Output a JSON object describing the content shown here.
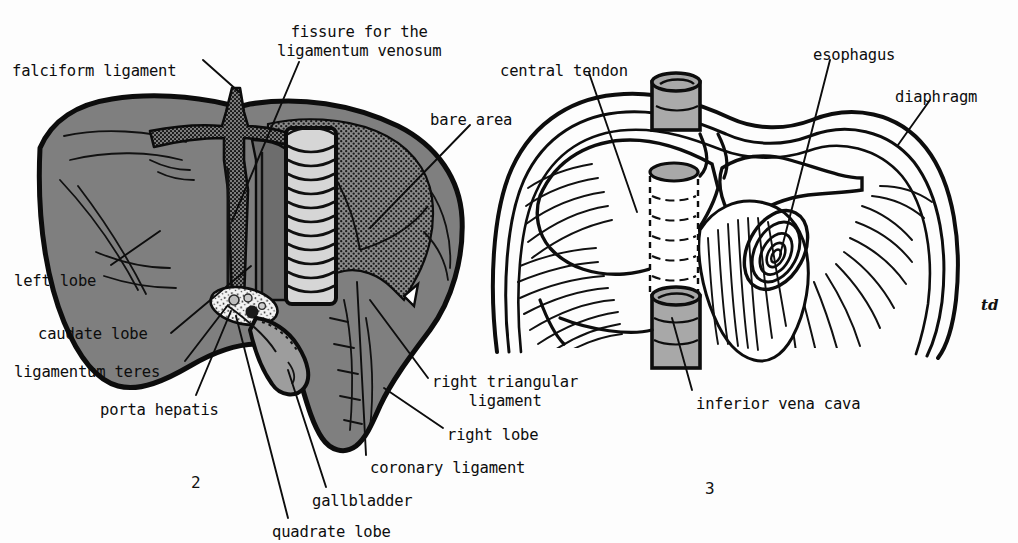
{
  "figure": {
    "type": "anatomical-illustration",
    "signature": "td",
    "background_color": "#ffffff",
    "ink_color": "#111111"
  },
  "palette": {
    "liver_fill": "#7f7f7f",
    "liver_outline": "#101010",
    "bare_area_stipple": "#6e6e6e",
    "ivc_cylinder": "#d2d2d2",
    "gallbladder": "#9a9a9a",
    "porta_hepatis": "#f2f2f2",
    "paper": "#ffffff"
  },
  "figure2": {
    "number": "2",
    "caption": "liver",
    "labels": [
      {
        "id": "falciform-ligament",
        "text": "falciform ligament",
        "x": 12,
        "y": 62,
        "align": "left"
      },
      {
        "id": "fissure-ligamentum-venosum",
        "text": "fissure for the\nligamentum venosum",
        "x": 277,
        "y": 23,
        "align": "left"
      },
      {
        "id": "bare-area",
        "text": "bare area",
        "x": 430,
        "y": 111,
        "align": "left"
      },
      {
        "id": "left-lobe",
        "text": "left lobe",
        "x": 14,
        "y": 272,
        "align": "left"
      },
      {
        "id": "caudate-lobe",
        "text": "caudate lobe",
        "x": 38,
        "y": 325,
        "align": "left"
      },
      {
        "id": "ligamentum-teres",
        "text": "ligamentum teres",
        "x": 14,
        "y": 363,
        "align": "left"
      },
      {
        "id": "porta-hepatis",
        "text": "porta hepatis",
        "x": 100,
        "y": 401,
        "align": "left"
      },
      {
        "id": "right-triangular-ligament",
        "text": "right triangular\n    ligament",
        "x": 432,
        "y": 373,
        "align": "left"
      },
      {
        "id": "right-lobe",
        "text": "right lobe",
        "x": 447,
        "y": 426,
        "align": "left"
      },
      {
        "id": "coronary-ligament",
        "text": "coronary ligament",
        "x": 370,
        "y": 459,
        "align": "left"
      },
      {
        "id": "gallbladder",
        "text": "gallbladder",
        "x": 312,
        "y": 492,
        "align": "left"
      },
      {
        "id": "quadrate-lobe",
        "text": "quadrate lobe",
        "x": 272,
        "y": 523,
        "align": "left"
      }
    ]
  },
  "figure3": {
    "number": "3",
    "caption": "diaphragm",
    "labels": [
      {
        "id": "central-tendon",
        "text": "central tendon",
        "x": 500,
        "y": 62,
        "align": "left"
      },
      {
        "id": "esophagus",
        "text": "esophagus",
        "x": 813,
        "y": 46,
        "align": "left"
      },
      {
        "id": "diaphragm",
        "text": "diaphragm",
        "x": 895,
        "y": 88,
        "align": "left"
      },
      {
        "id": "inferior-vena-cava",
        "text": "inferior vena cava",
        "x": 696,
        "y": 395,
        "align": "left"
      }
    ]
  },
  "figure_numbers": [
    {
      "id": "fig-2-number",
      "text": "2",
      "x": 191,
      "y": 473
    },
    {
      "id": "fig-3-number",
      "text": "3",
      "x": 705,
      "y": 479
    }
  ],
  "signature_mark": {
    "id": "artist-signature",
    "text": "td",
    "x": 981,
    "y": 296
  }
}
